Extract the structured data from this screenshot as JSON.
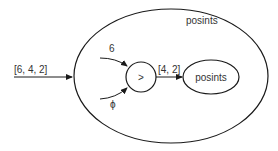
{
  "diagram": {
    "outer_process_label": "posints",
    "input_stream_label": "[6, 4, 2]",
    "head_label": "6",
    "tail_label": "ϕ",
    "operator_label": ">",
    "output_stream_label": "[4, 2]",
    "inner_process_label": "posints",
    "colors": {
      "stroke": "#1a1a1a",
      "text": "#333333"
    }
  }
}
